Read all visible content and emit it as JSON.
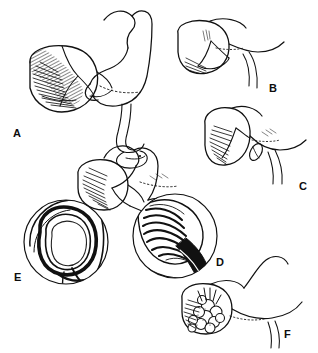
{
  "figure": {
    "kind": "anatomical-line-illustration",
    "ink_color": "#111111",
    "background_color": "#ffffff",
    "shading_color": "#2b2b2b",
    "width_px": 318,
    "height_px": 353
  },
  "panels": [
    {
      "id": "A",
      "label": "A",
      "type": "main-view",
      "description": "Stomach with pancreas and looping efferent limb, dense radiating hatching over pancreatic head"
    },
    {
      "id": "B",
      "label": "B",
      "type": "main-view",
      "description": "Smaller stomach and pancreas view with paired duct lines descending to the right"
    },
    {
      "id": "C",
      "label": "C",
      "type": "main-view",
      "description": "Stomach with hatched body and small oval structure at the duodenal junction"
    },
    {
      "id": "D",
      "label": "D",
      "type": "circular-inset",
      "description": "Magnified circular inset of striated mucosal folds with dark lumen"
    },
    {
      "id": "E",
      "label": "E",
      "type": "circular-inset",
      "description": "Magnified circular inset cross-section showing open ring lumen with thick dark wall"
    },
    {
      "id": "F",
      "label": "F",
      "type": "main-view",
      "description": "Stomach with nodular cauliflower-like mass at the antrum and hatched shading"
    }
  ]
}
